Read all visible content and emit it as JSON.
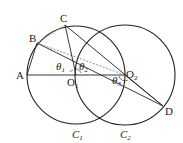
{
  "diagram": {
    "points": {
      "A": {
        "label": "A",
        "x": 27,
        "y": 75
      },
      "B": {
        "label": "B",
        "x": 37,
        "y": 43
      },
      "C": {
        "label": "C",
        "x": 65,
        "y": 25
      },
      "O1": {
        "label": "O",
        "sub": "1",
        "x": 76,
        "y": 75
      },
      "O2": {
        "label": "O",
        "sub": "2",
        "x": 125,
        "y": 75
      },
      "D": {
        "label": "D",
        "x": 163,
        "y": 106
      }
    },
    "circles": [
      {
        "name": "C1",
        "label": "C",
        "sub": "1",
        "cx": 76,
        "cy": 75,
        "r": 49
      },
      {
        "name": "C2",
        "label": "C",
        "sub": "2",
        "cx": 125,
        "cy": 75,
        "r": 50
      }
    ],
    "angles": [
      {
        "label": "θ",
        "sub": "1"
      },
      {
        "label": "θ",
        "sub": "2"
      },
      {
        "label": "θ",
        "sub": "3"
      }
    ],
    "colors": {
      "stroke": "#222222",
      "dashed": "#555555",
      "background": "#ffffff"
    }
  }
}
